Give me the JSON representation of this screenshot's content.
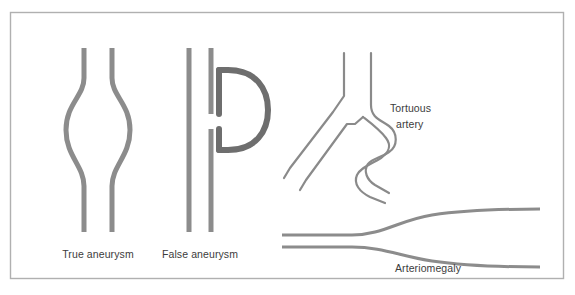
{
  "figure": {
    "background_color": "#ffffff",
    "border_color": "#b0b0b0",
    "vessel_wall_color": "#8c8c8c",
    "sac_outline_color": "#6e6e6e",
    "tortuous_line_color": "#8a8a8a",
    "label_color": "#3c3c3c"
  },
  "labels": {
    "true_aneurysm": "True aneurysm",
    "false_aneurysm": "False aneurysm",
    "tortuous_artery_line1": "Tortuous",
    "tortuous_artery_line2": "artery",
    "arteriomegaly": "Arteriomegaly"
  },
  "diagrams": [
    {
      "id": "true-aneurysm",
      "label": "True aneurysm",
      "description": "Fusiform symmetric bulge of the vessel wall; both walls dilate outward and return to normal caliber"
    },
    {
      "id": "false-aneurysm",
      "label": "False aneurysm",
      "description": "Straight vessel with a defect in one wall and a rounded saccular outpouching communicating through the gap"
    },
    {
      "id": "tortuous-artery",
      "label": "Tortuous artery",
      "description": "Branching artery with a serpentine, winding course of normal caliber"
    },
    {
      "id": "arteriomegaly",
      "label": "Arteriomegaly",
      "description": "Diffuse uniform enlargement of the artery, widening progressively along its length"
    }
  ]
}
